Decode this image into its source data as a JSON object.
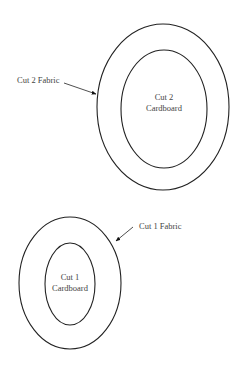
{
  "pattern": {
    "pieces": [
      {
        "id": "piece-2",
        "fabric_label": "Cut 2 Fabric",
        "cardboard_line1": "Cut 2",
        "cardboard_line2": "Cardboard",
        "outer": {
          "cx": 163,
          "cy": 107,
          "rx": 66,
          "ry": 83
        },
        "inner": {
          "cx": 164,
          "cy": 109,
          "rx": 43,
          "ry": 59
        }
      },
      {
        "id": "piece-1",
        "fabric_label": "Cut 1 Fabric",
        "cardboard_line1": "Cut 1",
        "cardboard_line2": "Cardboard",
        "outer": {
          "cx": 70,
          "cy": 283,
          "rx": 51,
          "ry": 66
        },
        "inner": {
          "cx": 70,
          "cy": 284,
          "rx": 25,
          "ry": 41
        }
      }
    ],
    "stroke_color": "#222222",
    "text_color": "#444444"
  }
}
